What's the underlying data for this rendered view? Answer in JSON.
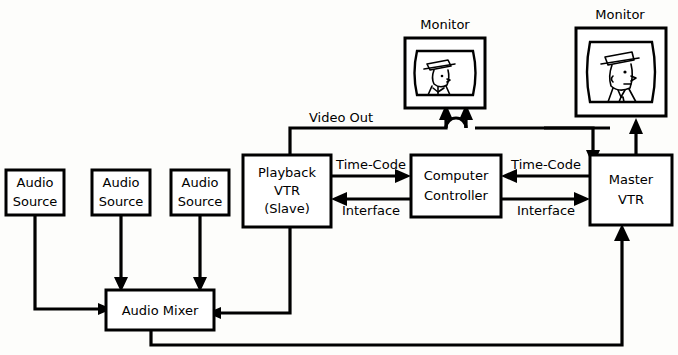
{
  "diagram": {
    "background_color": "#fdfdfb",
    "line_color": "#000000",
    "box_fill": "#ffffff",
    "nodes": {
      "audio_source_1": {
        "label_line1": "Audio",
        "label_line2": "Source"
      },
      "audio_source_2": {
        "label_line1": "Audio",
        "label_line2": "Source"
      },
      "audio_source_3": {
        "label_line1": "Audio",
        "label_line2": "Source"
      },
      "audio_mixer": {
        "label_line1": "Audio  Mixer"
      },
      "playback_vtr": {
        "label_line1": "Playback",
        "label_line2": "VTR",
        "label_line3": "(Slave)"
      },
      "computer_controller": {
        "label_line1": "Computer",
        "label_line2": "Controller"
      },
      "master_vtr": {
        "label_line1": "Master",
        "label_line2": "VTR"
      },
      "monitor_left": {
        "label": "Monitor"
      },
      "monitor_right": {
        "label": "Monitor"
      }
    },
    "edge_labels": {
      "video_out": "Video Out",
      "timecode_left": "Time-Code",
      "interface_left": "Interface",
      "timecode_right": "Time-Code",
      "interface_right": "Interface"
    }
  }
}
